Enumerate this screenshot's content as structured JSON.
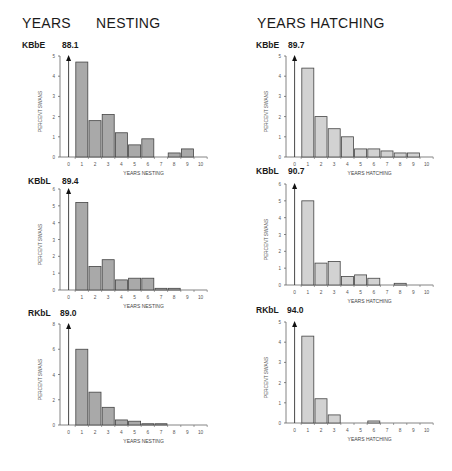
{
  "titles": {
    "left": "YEARS      NESTING",
    "right": "YEARS HATCHING"
  },
  "colors": {
    "nesting_bar": "#a9a9a9",
    "hatching_bar": "#d2d2d2",
    "outline": "#444444",
    "axis": "#666666"
  },
  "chart_data": [
    {
      "type": "bar",
      "id": "kbbe-nesting",
      "panel": "KBbE",
      "title": "YEARS NESTING",
      "zero_value_label": "88.1",
      "categories": [
        "0",
        "1",
        "2",
        "3",
        "4",
        "5",
        "6",
        "7",
        "8",
        "9",
        "10"
      ],
      "values": [
        88.1,
        4.7,
        1.8,
        2.1,
        1.2,
        0.6,
        0.9,
        0,
        0.2,
        0.4,
        0
      ],
      "xlabel": "YEARS NESTING",
      "ylabel": "PERCENT SWANS",
      "ylim": [
        0,
        5
      ],
      "yticks": [
        0,
        1,
        2,
        3,
        4,
        5
      ],
      "note": "Value at 0 years is off-scale, shown as upward arrow with label"
    },
    {
      "type": "bar",
      "id": "kbbl-nesting",
      "panel": "KBbL",
      "title": "YEARS NESTING",
      "zero_value_label": "89.4",
      "categories": [
        "0",
        "1",
        "2",
        "3",
        "4",
        "5",
        "6",
        "7",
        "8",
        "9",
        "10"
      ],
      "values": [
        89.4,
        5.2,
        1.4,
        1.8,
        0.6,
        0.7,
        0.7,
        0.1,
        0.1,
        0,
        0
      ],
      "xlabel": "YEARS NESTING",
      "ylabel": "PERCENT SWANS",
      "ylim": [
        0,
        6
      ],
      "yticks": [
        0,
        1,
        2,
        3,
        4,
        5,
        6
      ]
    },
    {
      "type": "bar",
      "id": "rkbl-nesting",
      "panel": "RKbL",
      "title": "YEARS NESTING",
      "zero_value_label": "89.0",
      "categories": [
        "0",
        "1",
        "2",
        "3",
        "4",
        "5",
        "6",
        "7",
        "8",
        "9",
        "10"
      ],
      "values": [
        89.0,
        6.0,
        2.6,
        1.4,
        0.4,
        0.3,
        0.1,
        0.1,
        0,
        0,
        0
      ],
      "xlabel": "YEARS NESTING",
      "ylabel": "PERCENT SWANS",
      "ylim": [
        0,
        8
      ],
      "yticks": [
        0,
        2,
        4,
        6,
        8
      ]
    },
    {
      "type": "bar",
      "id": "kbbe-hatching",
      "panel": "KBbE",
      "title": "YEARS HATCHING",
      "zero_value_label": "89.7",
      "categories": [
        "0",
        "1",
        "2",
        "3",
        "4",
        "5",
        "6",
        "7",
        "8",
        "9",
        "10"
      ],
      "values": [
        89.7,
        4.4,
        2.0,
        1.4,
        1.0,
        0.4,
        0.4,
        0.3,
        0.2,
        0.2,
        0
      ],
      "xlabel": "YEARS HATCHING",
      "ylabel": "PERCENT SWANS",
      "ylim": [
        0,
        5
      ],
      "yticks": [
        0,
        1,
        2,
        3,
        4,
        5
      ]
    },
    {
      "type": "bar",
      "id": "kbbl-hatching",
      "panel": "KBbL",
      "title": "YEARS HATCHING",
      "zero_value_label": "90.7",
      "categories": [
        "0",
        "1",
        "2",
        "3",
        "4",
        "5",
        "6",
        "7",
        "8",
        "9",
        "10"
      ],
      "values": [
        90.7,
        5.0,
        1.3,
        1.4,
        0.5,
        0.6,
        0.4,
        0,
        0.1,
        0,
        0
      ],
      "xlabel": "YEARS HATCHING",
      "ylabel": "PERCENT SWANS",
      "ylim": [
        0,
        6
      ],
      "yticks": [
        0,
        1,
        2,
        3,
        4,
        5,
        6
      ]
    },
    {
      "type": "bar",
      "id": "rkbl-hatching",
      "panel": "RKbL",
      "title": "YEARS HATCHING",
      "zero_value_label": "94.0",
      "categories": [
        "0",
        "1",
        "2",
        "3",
        "4",
        "5",
        "6",
        "7",
        "8",
        "9",
        "10"
      ],
      "values": [
        94.0,
        4.3,
        1.2,
        0.4,
        0,
        0,
        0.1,
        0,
        0,
        0,
        0
      ],
      "xlabel": "YEARS HATCHING",
      "ylabel": "PERCENT SWANS",
      "ylim": [
        0,
        5
      ],
      "yticks": [
        0,
        1,
        2,
        3,
        4,
        5
      ]
    }
  ]
}
